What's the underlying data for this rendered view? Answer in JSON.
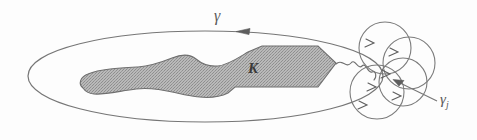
{
  "figure": {
    "background_color": "#fdfdfd",
    "stroke_color": "#6b6b6b",
    "fill_color": "#a9a9a9",
    "fill_pattern": "dithered-halftone-gray"
  },
  "labels": {
    "outer_contour": "γ",
    "compact_set": "K",
    "small_circle_base": "γ",
    "small_circle_subscript": "j"
  },
  "elements": {
    "outer_contour_name": "gamma",
    "compact_set_name": "K",
    "circle_family_name": "gamma_j",
    "circle_count": 4,
    "orientation_arrow_direction": "leftward",
    "leader_arrow_direction": "up-left"
  },
  "geometry": {
    "outer_ellipse": {
      "cx": 205,
      "cy": 76,
      "rx": 178,
      "ry": 46
    },
    "circles": [
      {
        "cx": 385,
        "cy": 48,
        "r": 26
      },
      {
        "cx": 408,
        "cy": 62,
        "r": 26
      },
      {
        "cx": 378,
        "cy": 92,
        "r": 27
      },
      {
        "cx": 404,
        "cy": 84,
        "r": 24
      }
    ],
    "gamma_arrow": {
      "x": 238,
      "y": 32
    },
    "leader_line": {
      "x1": 437,
      "y1": 101,
      "x2": 392,
      "y2": 79
    }
  }
}
